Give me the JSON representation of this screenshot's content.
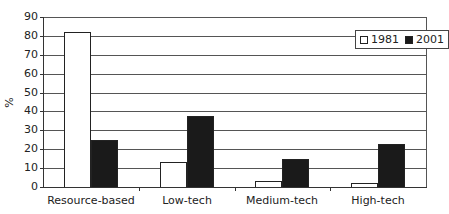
{
  "chart_data": {
    "type": "bar",
    "title": "",
    "xlabel": "",
    "ylabel": "%",
    "ylim": [
      0,
      90
    ],
    "yticks": [
      0,
      10,
      20,
      30,
      40,
      50,
      60,
      70,
      80,
      90
    ],
    "grid": true,
    "legend_position": "top-right",
    "categories": [
      "Resource-based",
      "Low-tech",
      "Medium-tech",
      "High-tech"
    ],
    "series": [
      {
        "name": "1981",
        "color": "#ffffff",
        "values": [
          82,
          13,
          3,
          2
        ]
      },
      {
        "name": "2001",
        "color": "#1a1a1a",
        "values": [
          25,
          37.5,
          15,
          23
        ]
      }
    ]
  }
}
